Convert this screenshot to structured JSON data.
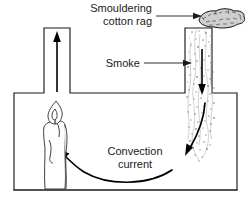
{
  "figure": {
    "background_color": "#ffffff",
    "ink_color": "#1a1a1a"
  },
  "labels": {
    "smouldering_rag_line1": "Smouldering",
    "smouldering_rag_line2": "cotton rag",
    "smoke": "Smoke",
    "convection_line1": "Convection",
    "convection_line2": "current"
  },
  "parts": {
    "chamber": "convection-box",
    "left_chimney": "left-chimney",
    "right_chimney": "right-chimney",
    "candle": "candle",
    "flame": "candle-flame",
    "rag": "smouldering-cotton-rag",
    "smoke_column": "smoke-column"
  },
  "arrows": {
    "up_arrow": "warm-air-rising-arrow",
    "down_arrow": "smoke-descending-arrow",
    "convection_curve": "convection-current-curve",
    "rag_leader": "smouldering-rag-leader",
    "smoke_leader": "smoke-leader"
  }
}
